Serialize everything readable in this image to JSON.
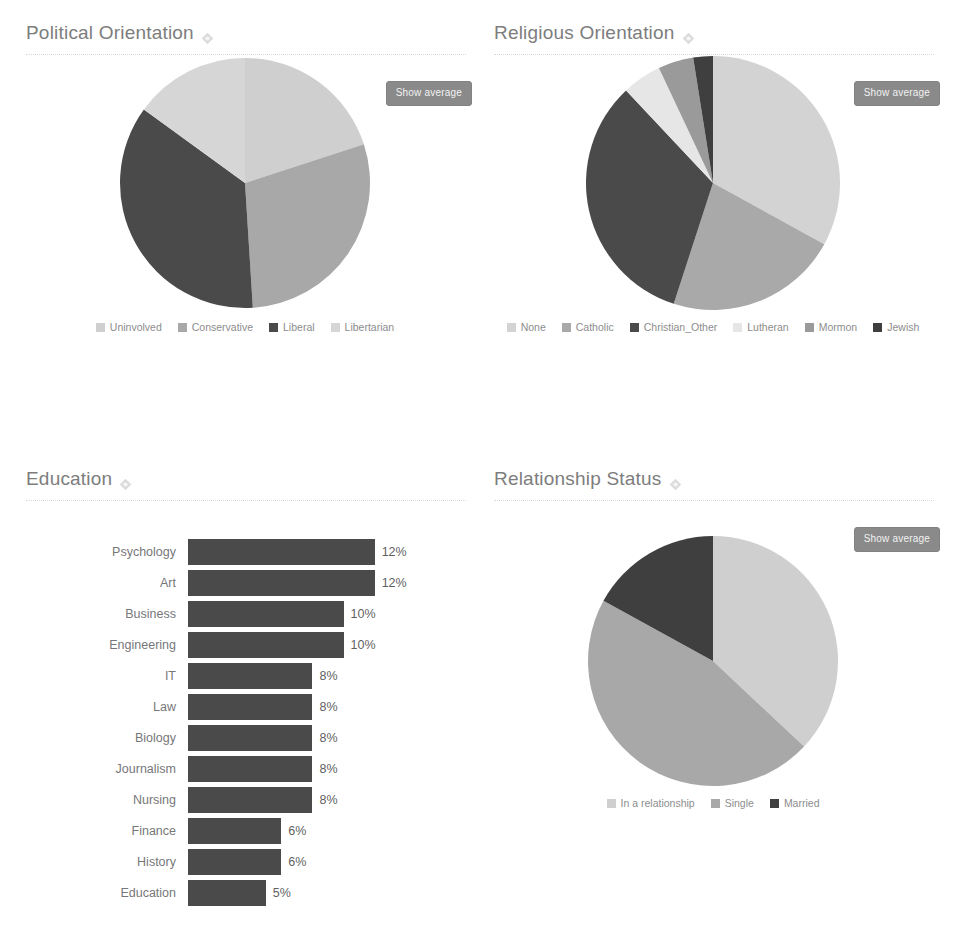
{
  "theme": {
    "background": "#ffffff",
    "title_color": "#7d7d7d",
    "text_color": "#6b6b6b",
    "button_bg": "#8a8a8a",
    "bar_color": "#4a4a4a",
    "palette": [
      "#cfcfcf",
      "#a8a8a8",
      "#4a4a4a",
      "#e2e2e2",
      "#8f8f8f",
      "#3f3f3f"
    ]
  },
  "buttons": {
    "show_average": "Show average"
  },
  "panels": {
    "political": {
      "title": "Political Orientation",
      "info_icon": "info-icon"
    },
    "religious": {
      "title": "Religious Orientation",
      "info_icon": "info-icon"
    },
    "education": {
      "title": "Education",
      "info_icon": "info-icon"
    },
    "relationship": {
      "title": "Relationship Status",
      "info_icon": "info-icon"
    }
  },
  "chart_data": [
    {
      "id": "political",
      "type": "pie",
      "title": "Political Orientation",
      "legend_position": "bottom",
      "categories": [
        "Uninvolved",
        "Conservative",
        "Liberal",
        "Libertarian"
      ],
      "values": [
        20,
        29,
        36,
        15
      ],
      "colors": [
        "#cfcfcf",
        "#a8a8a8",
        "#4a4a4a",
        "#d6d6d6"
      ]
    },
    {
      "id": "religious",
      "type": "pie",
      "title": "Religious Orientation",
      "legend_position": "bottom",
      "categories": [
        "None",
        "Catholic",
        "Christian_Other",
        "Lutheran",
        "Mormon",
        "Jewish"
      ],
      "values": [
        33,
        22,
        33,
        5,
        4.5,
        2.5
      ],
      "colors": [
        "#d3d3d3",
        "#a9a9a9",
        "#4a4a4a",
        "#e6e6e6",
        "#9a9a9a",
        "#3f3f3f"
      ]
    },
    {
      "id": "education",
      "type": "bar",
      "title": "Education",
      "orientation": "horizontal",
      "xlabel": "",
      "ylabel": "",
      "categories": [
        "Psychology",
        "Art",
        "Business",
        "Engineering",
        "IT",
        "Law",
        "Biology",
        "Journalism",
        "Nursing",
        "Finance",
        "History",
        "Education"
      ],
      "values": [
        12,
        12,
        10,
        10,
        8,
        8,
        8,
        8,
        8,
        6,
        6,
        5
      ],
      "value_labels": [
        "12%",
        "12%",
        "10%",
        "10%",
        "8%",
        "8%",
        "8%",
        "8%",
        "8%",
        "6%",
        "6%",
        "5%"
      ],
      "xlim": [
        0,
        13.5
      ],
      "grid": false,
      "bar_color": "#4a4a4a"
    },
    {
      "id": "relationship",
      "type": "pie",
      "title": "Relationship Status",
      "legend_position": "bottom",
      "categories": [
        "In a relationship",
        "Single",
        "Married"
      ],
      "values": [
        37,
        46,
        17
      ],
      "colors": [
        "#cfcfcf",
        "#a8a8a8",
        "#3f3f3f"
      ]
    }
  ]
}
